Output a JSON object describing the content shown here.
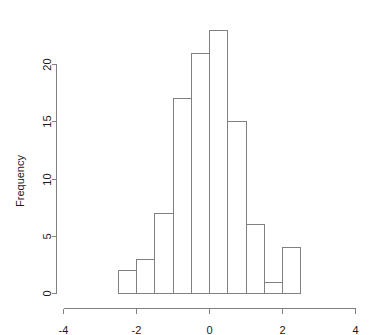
{
  "chart_data": {
    "type": "bar",
    "subtype": "histogram",
    "title": "",
    "xlabel": "",
    "ylabel": "Frequency",
    "xlim": [
      -4,
      4
    ],
    "ylim": [
      0,
      20
    ],
    "grid": false,
    "legend": null,
    "bin_width": 0.5,
    "bin_edges": [
      -2.5,
      -2.0,
      -1.5,
      -1.0,
      -0.5,
      0.0,
      0.5,
      1.0,
      1.5,
      2.0,
      2.5
    ],
    "categories": [
      "[-2.5,-2.0)",
      "[-2.0,-1.5)",
      "[-1.5,-1.0)",
      "[-1.0,-0.5)",
      "[-0.5,0.0)",
      "[0.0,0.5)",
      "[0.5,1.0)",
      "[1.0,1.5)",
      "[1.5,2.0)",
      "[2.0,2.5)"
    ],
    "bin_centers": [
      -2.25,
      -1.75,
      -1.25,
      -0.75,
      -0.25,
      0.25,
      0.75,
      1.25,
      1.75,
      2.25
    ],
    "values": [
      2,
      3,
      7,
      17,
      21,
      23,
      15,
      6,
      1,
      4
    ],
    "total_count": 99,
    "x_ticks": [
      -4,
      -2,
      0,
      2,
      4
    ],
    "x_tick_labels": [
      "-4",
      "-2",
      "0",
      "2",
      "4"
    ],
    "y_ticks": [
      0,
      5,
      10,
      15,
      20
    ],
    "y_tick_labels": [
      "0",
      "5",
      "10",
      "15",
      "20"
    ],
    "colors": {
      "bar_fill": "#ffffff",
      "bar_stroke": "#808080",
      "axis": "#808080",
      "text": "#1a1a1a",
      "background": "#ffffff"
    }
  },
  "labels": {
    "y_axis_title": "Frequency",
    "x_axis_title": ""
  }
}
